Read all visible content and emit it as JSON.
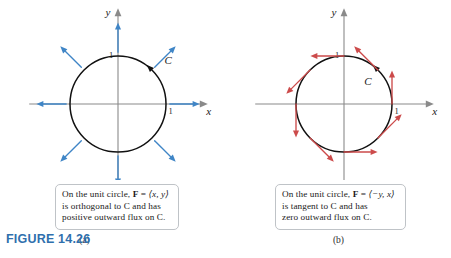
{
  "figure": {
    "number_label": "FIGURE 14.26",
    "number_color": "#2f6fad",
    "background": "#ffffff"
  },
  "panels": [
    {
      "id": "a",
      "sub_label": "(a)",
      "field_color": "#3f85c6",
      "curve_color": "#111111",
      "axis_color": "#8a8a8a",
      "curve_label": "C",
      "axis": {
        "x_name": "x",
        "y_name": "y",
        "x_tick_label": "1",
        "y_tick_label": "1"
      },
      "caption": {
        "line1_pre": "On the unit circle, ",
        "line1_bold": "F",
        "line1_mid": " = ",
        "line1_vec": "⟨x, y⟩",
        "line2": "is orthogonal to C and has",
        "line3": "positive outward flux on C."
      }
    },
    {
      "id": "b",
      "sub_label": "(b)",
      "field_color": "#cc4b4b",
      "curve_color": "#111111",
      "axis_color": "#8a8a8a",
      "curve_label": "C",
      "axis": {
        "x_name": "x",
        "y_name": "y",
        "x_tick_label": "1",
        "y_tick_label": "1"
      },
      "caption": {
        "line1_pre": "On the unit circle, ",
        "line1_bold": "F",
        "line1_mid": " = ",
        "line1_vec": "⟨−y, x⟩",
        "line2": "is tangent to C and has",
        "line3": "zero outward flux on C."
      }
    }
  ],
  "chart_data": [
    {
      "type": "scatter",
      "title": "On the unit circle, F = <x, y> is orthogonal to C and has positive outward flux on C.",
      "subtitle": "(a)",
      "xlabel": "x",
      "ylabel": "y",
      "xlim": [
        -1.85,
        1.85
      ],
      "ylim": [
        -1.85,
        1.85
      ],
      "grid": false,
      "legend": null,
      "curve": {
        "name": "C",
        "shape": "unit circle",
        "center": [
          0,
          0
        ],
        "radius": 1,
        "orientation": "counterclockwise",
        "orientation_marker_angle_deg": 45
      },
      "vector_field": {
        "formula": "F = <x, y>",
        "description": "radial, pointing outward, orthogonal to C",
        "arrow_length": 0.62,
        "base_radius": 1.08,
        "arrows": [
          {
            "angle_deg": 0,
            "base": [
              1.08,
              0
            ],
            "tip": [
              1.7,
              0
            ]
          },
          {
            "angle_deg": 45,
            "base": [
              0.764,
              0.764
            ],
            "tip": [
              1.202,
              1.202
            ]
          },
          {
            "angle_deg": 90,
            "base": [
              0,
              1.08
            ],
            "tip": [
              0,
              1.7
            ]
          },
          {
            "angle_deg": 135,
            "base": [
              -0.764,
              0.764
            ],
            "tip": [
              -1.202,
              1.202
            ]
          },
          {
            "angle_deg": 180,
            "base": [
              -1.08,
              0
            ],
            "tip": [
              -1.7,
              0
            ]
          },
          {
            "angle_deg": 225,
            "base": [
              -0.764,
              -0.764
            ],
            "tip": [
              -1.202,
              -1.202
            ]
          },
          {
            "angle_deg": 270,
            "base": [
              0,
              -1.08
            ],
            "tip": [
              0,
              -1.7
            ]
          },
          {
            "angle_deg": 315,
            "base": [
              0.764,
              -0.764
            ],
            "tip": [
              1.202,
              -1.202
            ]
          }
        ]
      },
      "ticks": {
        "x": [
          1
        ],
        "y": [
          1
        ]
      }
    },
    {
      "type": "scatter",
      "title": "On the unit circle, F = <-y, x> is tangent to C and has zero outward flux on C.",
      "subtitle": "(b)",
      "xlabel": "x",
      "ylabel": "y",
      "xlim": [
        -1.85,
        1.85
      ],
      "ylim": [
        -1.85,
        1.85
      ],
      "grid": false,
      "legend": null,
      "curve": {
        "name": "C",
        "shape": "unit circle",
        "center": [
          0,
          0
        ],
        "radius": 1,
        "orientation": "counterclockwise",
        "orientation_marker_angle_deg": 45
      },
      "vector_field": {
        "formula": "F = <-y, x>",
        "description": "tangent to C, counterclockwise, zero outward flux",
        "arrow_length": 0.7,
        "arrows": [
          {
            "angle_deg": 0,
            "base": [
              1.0,
              0
            ],
            "tip": [
              1.0,
              0.7
            ]
          },
          {
            "angle_deg": 45,
            "base": [
              0.707,
              0.707
            ],
            "tip": [
              0.212,
              1.202
            ]
          },
          {
            "angle_deg": 90,
            "base": [
              0,
              1.0
            ],
            "tip": [
              -0.7,
              1.0
            ]
          },
          {
            "angle_deg": 135,
            "base": [
              -0.707,
              0.707
            ],
            "tip": [
              -1.202,
              0.212
            ]
          },
          {
            "angle_deg": 180,
            "base": [
              -1.0,
              0
            ],
            "tip": [
              -1.0,
              -0.7
            ]
          },
          {
            "angle_deg": 225,
            "base": [
              -0.707,
              -0.707
            ],
            "tip": [
              -0.212,
              -1.202
            ]
          },
          {
            "angle_deg": 270,
            "base": [
              0,
              -1.0
            ],
            "tip": [
              0.7,
              -1.0
            ]
          },
          {
            "angle_deg": 315,
            "base": [
              0.707,
              -0.707
            ],
            "tip": [
              1.202,
              -0.212
            ]
          }
        ]
      },
      "ticks": {
        "x": [
          1
        ],
        "y": [
          1
        ]
      }
    }
  ]
}
